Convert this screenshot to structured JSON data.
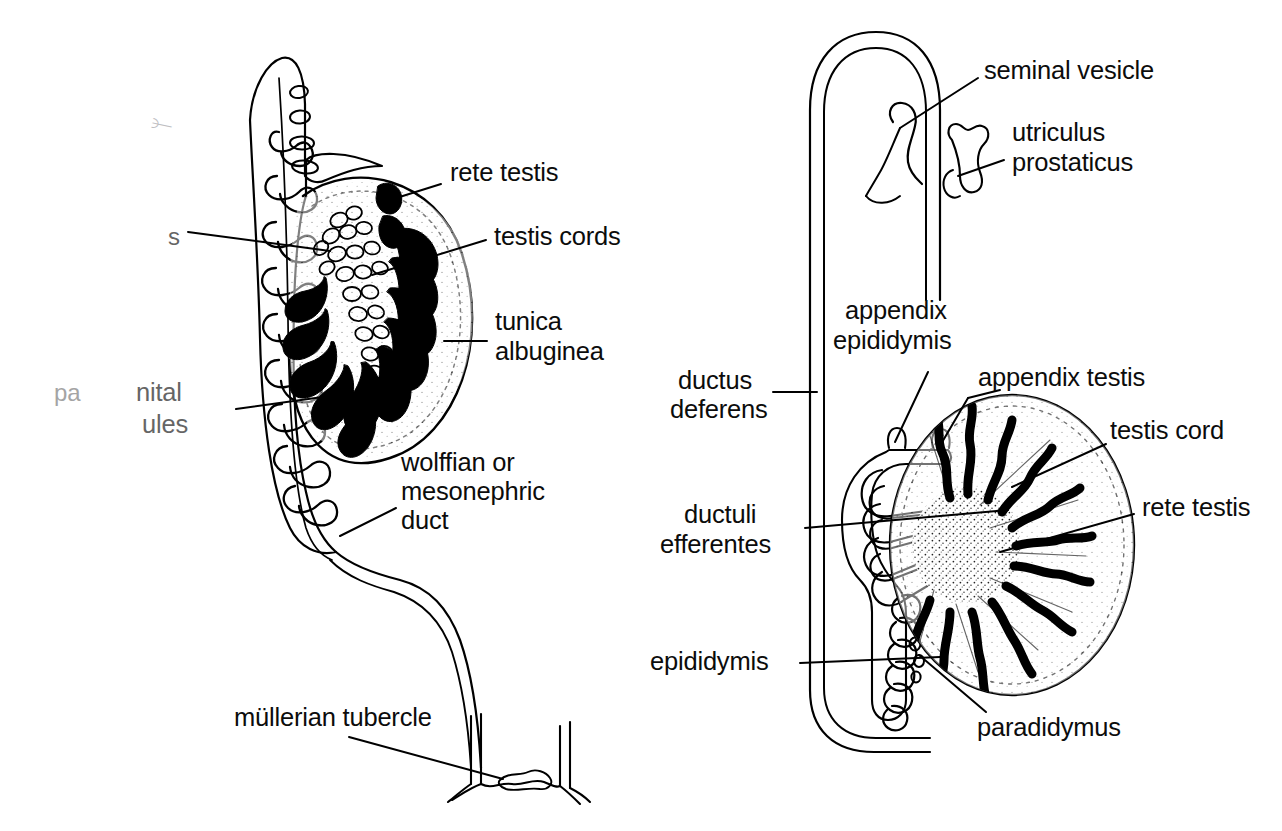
{
  "figure": {
    "background_color": "#ffffff",
    "ink_color": "#000000",
    "panels": [
      {
        "id": "left-panel",
        "name": "indifferent-gonad-and-mesonephros",
        "description": "Sagittal view of developing testis with mesonephric tubules, wolffian duct descending to the mullerian tubercle"
      },
      {
        "id": "right-panel",
        "name": "differentiated-testis-and-excurrent-ducts",
        "description": "Testis with radiating testis cords and central rete testis, epididymis, ductus deferens loop, seminal vesicle and utriculus prostaticus"
      }
    ]
  },
  "left_labels": {
    "rete_testis": "rete testis",
    "testis_cords": "testis cords",
    "tunica_line1": "tunica",
    "tunica_line2": "albuginea",
    "wolffian_line1": "wolffian or",
    "wolffian_line2": "mesonephric",
    "wolffian_line3": "duct",
    "mullerian_tubercle": "müllerian tubercle",
    "partial_s": "s",
    "partial_pa": "pa",
    "partial_nital": "nital",
    "partial_bules": "ules"
  },
  "right_labels": {
    "seminal_vesicle": "seminal vesicle",
    "utriculus_line1": "utriculus",
    "utriculus_line2": "prostaticus",
    "ductus_line1": "ductus",
    "ductus_line2": "deferens",
    "appendix_epididymis_line1": "appendix",
    "appendix_epididymis_line2": "epididymis",
    "appendix_testis": "appendix testis",
    "testis_cord": "testis cord",
    "rete_testis": "rete testis",
    "ductuli_line1": "ductuli",
    "ductuli_line2": "efferentes",
    "epididymis": "epididymis",
    "paradidymus": "paradidymus"
  },
  "colors": {
    "ink": "#000000",
    "paper": "#ffffff",
    "faded_ink": "#6e6e6e",
    "pencil": "#8c8c92"
  }
}
